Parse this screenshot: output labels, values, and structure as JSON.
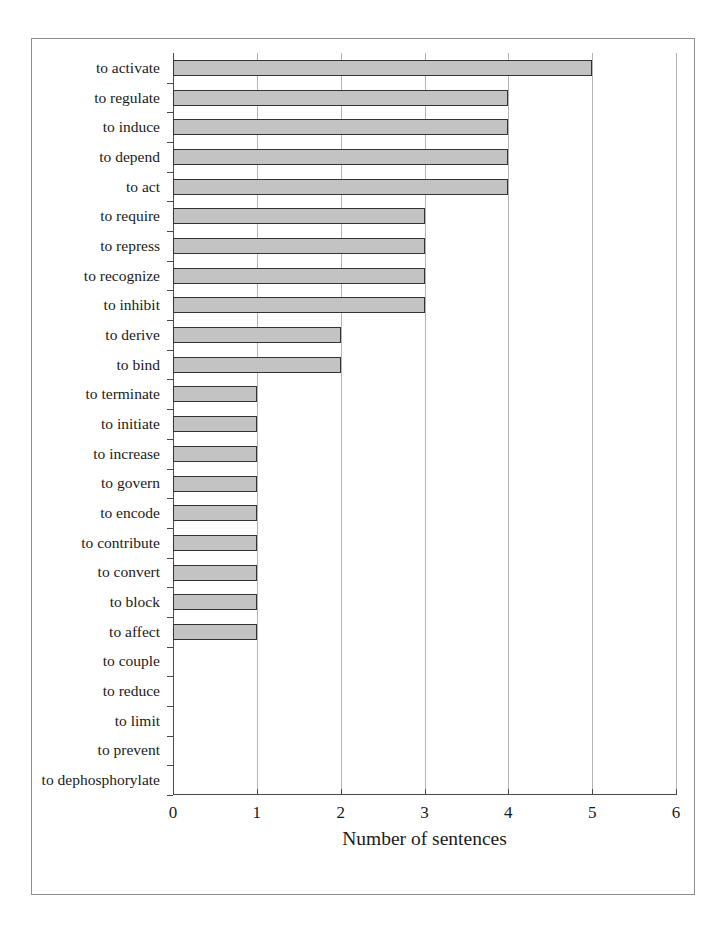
{
  "chart_data": {
    "type": "bar",
    "orientation": "horizontal",
    "title": "",
    "xlabel": "Number of sentences",
    "ylabel": "",
    "xlim": [
      0,
      6
    ],
    "xticks": [
      "0",
      "1",
      "2",
      "3",
      "4",
      "5",
      "6"
    ],
    "grid": true,
    "legend": null,
    "categories": [
      "to activate",
      "to regulate",
      "to induce",
      "to depend",
      "to act",
      "to require",
      "to repress",
      "to recognize",
      "to inhibit",
      "to derive",
      "to bind",
      "to terminate",
      "to initiate",
      "to increase",
      "to govern",
      "to encode",
      "to contribute",
      "to convert",
      "to block",
      "to affect",
      "to couple",
      "to reduce",
      "to limit",
      "to prevent",
      "to dephosphorylate"
    ],
    "values": [
      5,
      4,
      4,
      4,
      4,
      3,
      3,
      3,
      3,
      2,
      2,
      1,
      1,
      1,
      1,
      1,
      1,
      1,
      1,
      1,
      0,
      0,
      0,
      0,
      0
    ],
    "colors": {
      "bar_fill": "#c3c3c3",
      "bar_border": "#333333",
      "gridline": "#b4b4b4",
      "axis": "#4a4a4a",
      "frame": "#8e8e8e",
      "background": "#ffffff",
      "text": "#1a1a1a"
    }
  }
}
